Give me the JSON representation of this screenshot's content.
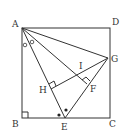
{
  "diagram": {
    "type": "geometry",
    "labels": {
      "A": "A",
      "B": "B",
      "C": "C",
      "D": "D",
      "E": "E",
      "F": "F",
      "G": "G",
      "H": "H",
      "I": "I"
    },
    "shapes": [
      "square ABCD",
      "segment AE",
      "segment AG",
      "segment AF",
      "segment EG",
      "segment GH",
      "right angle at B",
      "right angle at H",
      "right angle at F"
    ],
    "angle_marks": [
      "equal angles at A (open circles)",
      "equal angles at E (filled dots)"
    ]
  }
}
